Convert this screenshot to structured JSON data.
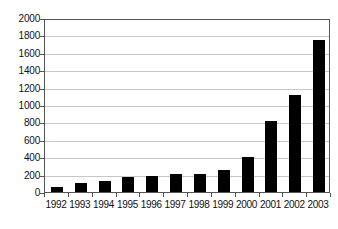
{
  "chart_data": {
    "type": "bar",
    "title": "",
    "subtitle": "",
    "xlabel": "",
    "ylabel": "",
    "categories": [
      "1992",
      "1993",
      "1994",
      "1995",
      "1996",
      "1997",
      "1998",
      "1999",
      "2000",
      "2001",
      "2002",
      "2003"
    ],
    "values": [
      60,
      100,
      130,
      175,
      185,
      205,
      210,
      250,
      400,
      820,
      1120,
      1750
    ],
    "series": [
      {
        "name": "",
        "values": [
          60,
          100,
          130,
          175,
          185,
          205,
          210,
          250,
          400,
          820,
          1120,
          1750
        ]
      }
    ],
    "ylim": [
      0,
      2000
    ],
    "ytick_labels": [
      "2000",
      "1800",
      "1600",
      "1400",
      "1200",
      "1000",
      "800",
      "600",
      "400",
      "200",
      "0"
    ],
    "ytick_values": [
      2000,
      1800,
      1600,
      1400,
      1200,
      1000,
      800,
      600,
      400,
      200,
      0
    ],
    "ytick_interval": 200,
    "grid": true,
    "grid_axis": "y",
    "legend": false,
    "legend_position": "none",
    "bar_color": "#000000",
    "grid_color": "#c8c8c8",
    "axis_color": "#555555",
    "background_color": "#ffffff",
    "annotations": []
  }
}
